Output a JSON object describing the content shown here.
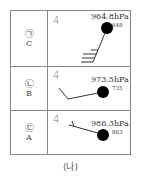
{
  "figure": {
    "caption": "(나)",
    "north_symbol": "4",
    "rows": [
      {
        "marker": "㉠",
        "station": "C",
        "pressure": "964.8hPa",
        "height": "648",
        "wind": "3 full barbs + half barb, staff toward lower-left"
      },
      {
        "marker": "㉡",
        "station": "B",
        "pressure": "973.5hPa",
        "height": "735",
        "wind": "1 full barb, staff toward left"
      },
      {
        "marker": "㉢",
        "station": "A",
        "pressure": "986.3hPa",
        "height": "863",
        "wind": "half barb, staff toward upper-left"
      }
    ]
  },
  "colors": {
    "ink": "#333333",
    "border": "#888888",
    "station_dot": "#000000"
  }
}
